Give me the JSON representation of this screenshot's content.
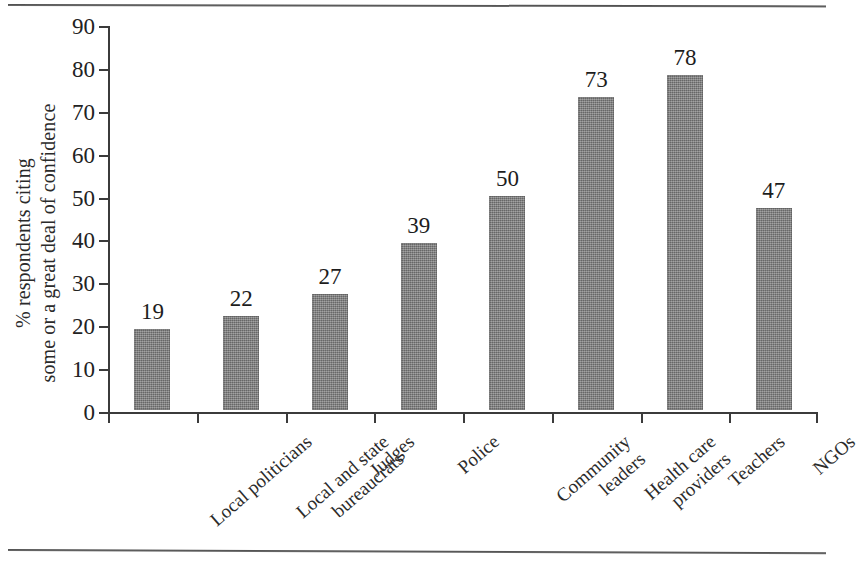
{
  "figure": {
    "background_color": "#ffffff",
    "bar_color": "#7e7e7e",
    "axis_color": "#3b3b3b",
    "text_color": "#1d1d1d"
  },
  "chart_data": {
    "type": "bar",
    "title": "",
    "xlabel": "",
    "ylabel": "% respondents citing some or a great deal of confidence",
    "ylabel_lines": [
      "% respondents citing",
      "some or a great deal of confidence"
    ],
    "categories": [
      "Local politicians",
      "Local and state bureaucrats",
      "Judges",
      "Police",
      "Community leaders",
      "Health care providers",
      "Teachers",
      "NGOs"
    ],
    "category_label_lines": [
      [
        "Local politicians"
      ],
      [
        "Local and state",
        "bureaucrats"
      ],
      [
        "Judges"
      ],
      [
        "Police"
      ],
      [
        "Community",
        "leaders"
      ],
      [
        "Health care",
        "providers"
      ],
      [
        "Teachers"
      ],
      [
        "NGOs"
      ]
    ],
    "values": [
      19,
      22,
      27,
      39,
      50,
      73,
      78,
      47
    ],
    "value_labels": [
      "19",
      "22",
      "27",
      "39",
      "50",
      "73",
      "78",
      "47"
    ],
    "ylim": [
      0,
      90
    ],
    "ytick_values": [
      0,
      10,
      20,
      30,
      40,
      50,
      60,
      70,
      80,
      90
    ],
    "ytick_labels": [
      "0",
      "10",
      "20",
      "30",
      "40",
      "50",
      "60",
      "70",
      "80",
      "90"
    ],
    "grid": false,
    "legend": null,
    "legend_position": "none",
    "bar_labels_shown": true
  }
}
